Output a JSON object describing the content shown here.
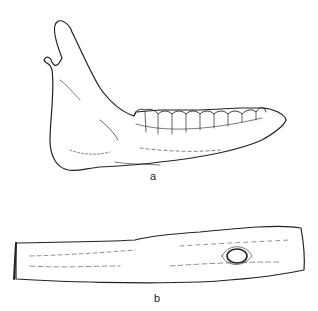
{
  "figures": [
    {
      "id": "a",
      "label": "a",
      "subject": "mandible (lower jawbone) with teeth, lateral view"
    },
    {
      "id": "b",
      "label": "b",
      "subject": "perforated bone tube with hole"
    }
  ],
  "colors": {
    "line": "#222222",
    "background": "#ffffff"
  }
}
